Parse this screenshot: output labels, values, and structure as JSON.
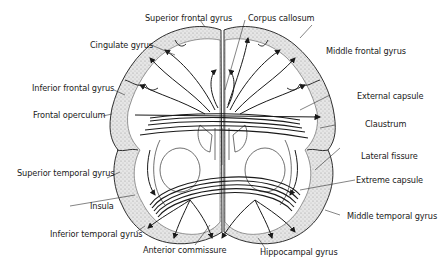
{
  "diagram": {
    "type": "anatomical-brain-section",
    "labels": {
      "superior_frontal_gyrus": "Superior frontal gyrus",
      "corpus_callosum": "Corpus callosum",
      "cingulate_gyrus": "Cingulate gyrus",
      "middle_frontal_gyrus": "Middle frontal gyrus",
      "inferior_frontal_gyrus": "Inferior frontal gyrus",
      "external_capsule": "External capsule",
      "frontal_operculum": "Frontal operculum",
      "claustrum": "Claustrum",
      "lateral_fissure": "Lateral fissure",
      "superior_temporal_gyrus": "Superior temporal gyrus",
      "extreme_capsule": "Extreme capsule",
      "insula": "Insula",
      "middle_temporal_gyrus": "Middle temporal gyrus",
      "inferior_temporal_gyrus": "Inferior temporal gyrus",
      "anterior_commissure": "Anterior commissure",
      "hippocampal_gyrus": "Hippocampal gyrus"
    },
    "colors": {
      "ink": "#1a1a1a",
      "cortex_fill": "#dcdcdc",
      "background": "#ffffff"
    }
  }
}
